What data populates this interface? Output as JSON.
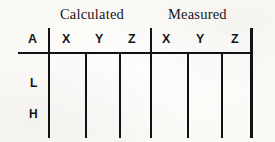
{
  "table": {
    "group_headers": [
      {
        "label": "Calculated",
        "span": 3
      },
      {
        "label": "Measured",
        "span": 3
      }
    ],
    "corner_header": "A",
    "column_headers": [
      "X",
      "Y",
      "Z",
      "X",
      "Y",
      "Z"
    ],
    "row_labels": [
      "L",
      "H"
    ],
    "rows": [
      {
        "label": "L",
        "cells": [
          "",
          "",
          "",
          "",
          "",
          ""
        ]
      },
      {
        "label": "H",
        "cells": [
          "",
          "",
          "",
          "",
          "",
          ""
        ]
      }
    ],
    "colors": {
      "ink": "#121215",
      "paper": "#fbfaf7"
    }
  }
}
